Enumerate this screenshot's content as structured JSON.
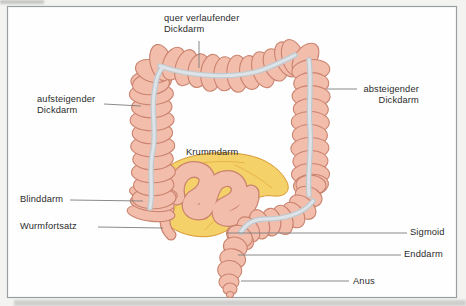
{
  "labels": {
    "transverse_colon": [
      "quer verlaufender",
      "Dickdarm"
    ],
    "ascending_colon": [
      "aufsteigender",
      "Dickdarm"
    ],
    "descending_colon": [
      "absteigender",
      "Dickdarm"
    ],
    "ileum": [
      "Krummdarm"
    ],
    "cecum": [
      "Blinddarm"
    ],
    "appendix": [
      "Wurmfortsatz"
    ],
    "sigmoid": [
      "Sigmoid"
    ],
    "rectum": [
      "Enddarm"
    ],
    "anus": [
      "Anus"
    ]
  },
  "colors": {
    "intestine_fill": "#f3bdac",
    "intestine_outline": "#c9836e",
    "taenia_gray": "#c6cfd5",
    "mesentery_fill": "#f5d169",
    "mesentery_outline": "#d9982f",
    "leader_line": "#7d7d7d",
    "frame_border": "#9aa0a2",
    "text": "#2b2b2b"
  }
}
